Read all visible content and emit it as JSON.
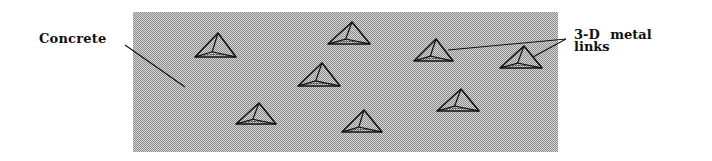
{
  "figure": {
    "labels": {
      "concrete": "Concrete",
      "links_line1": "3-D  metal",
      "links_line2": "links"
    },
    "slab": {
      "x": 133,
      "y": 12,
      "width": 425,
      "height": 140,
      "pattern_dark": "#8a8a8a",
      "pattern_light": "#d8d8d8"
    },
    "links": [
      {
        "id": 1,
        "apex": [
          218,
          33
        ],
        "base_left": [
          195,
          57
        ],
        "base_right": [
          236,
          57
        ]
      },
      {
        "id": 2,
        "apex": [
          352,
          22
        ],
        "base_left": [
          328,
          44
        ],
        "base_right": [
          370,
          44
        ]
      },
      {
        "id": 3,
        "apex": [
          322,
          63
        ],
        "base_left": [
          298,
          86
        ],
        "base_right": [
          340,
          86
        ]
      },
      {
        "id": 4,
        "apex": [
          259,
          103
        ],
        "base_left": [
          236,
          124
        ],
        "base_right": [
          276,
          124
        ]
      },
      {
        "id": 5,
        "apex": [
          364,
          110
        ],
        "base_left": [
          342,
          132
        ],
        "base_right": [
          382,
          132
        ]
      },
      {
        "id": 6,
        "apex": [
          436,
          39
        ],
        "base_left": [
          414,
          61
        ],
        "base_right": [
          453,
          61
        ]
      },
      {
        "id": 7,
        "apex": [
          461,
          89
        ],
        "base_left": [
          437,
          111
        ],
        "base_right": [
          479,
          111
        ]
      },
      {
        "id": 8,
        "apex": [
          524,
          46
        ],
        "base_left": [
          500,
          68
        ],
        "base_right": [
          542,
          68
        ]
      }
    ],
    "leaders": {
      "concrete": {
        "from": [
          125,
          45
        ],
        "to": [
          185,
          87
        ]
      },
      "links": [
        {
          "from": [
            566,
            39
          ],
          "to": [
            448,
            50
          ]
        },
        {
          "from": [
            566,
            39
          ],
          "to": [
            533,
            57
          ]
        }
      ]
    },
    "line_color": "#111111"
  }
}
